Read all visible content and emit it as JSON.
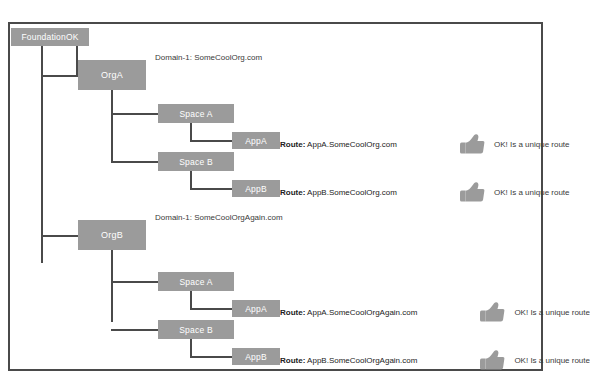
{
  "diagram": {
    "root": {
      "label": "FoundationOK"
    },
    "orgs": [
      {
        "label": "OrgA",
        "domain_label": "Domain-1: SomeCoolOrg.com",
        "spaces": [
          {
            "label": "Space A",
            "app": {
              "label": "AppA",
              "route_key": "Route:",
              "route_value": "AppA.SomeCoolOrg.com",
              "status_icon": "thumbs-up-icon",
              "status_text": "OK! Is a unique route"
            }
          },
          {
            "label": "Space B",
            "app": {
              "label": "AppB",
              "route_key": "Route:",
              "route_value": "AppB.SomeCoolOrg.com",
              "status_icon": "thumbs-up-icon",
              "status_text": "OK! Is a unique route"
            }
          }
        ]
      },
      {
        "label": "OrgB",
        "domain_label": "Domain-1: SomeCoolOrgAgain.com",
        "spaces": [
          {
            "label": "Space A",
            "app": {
              "label": "AppA",
              "route_key": "Route:",
              "route_value": "AppA.SomeCoolOrgAgain.com",
              "status_icon": "thumbs-up-icon",
              "status_text": "OK! Is a unique route"
            }
          },
          {
            "label": "Space B",
            "app": {
              "label": "AppB",
              "route_key": "Route:",
              "route_value": "AppB.SomeCoolOrgAgain.com",
              "status_icon": "thumbs-up-icon",
              "status_text": "OK! Is a unique route"
            }
          }
        ]
      }
    ]
  },
  "colors": {
    "node_fill": "#9b9b9b",
    "node_text": "#ffffff",
    "connector": "#4a4a4a",
    "frame_border": "#4a4a4a",
    "background": "#ffffff",
    "icon_fill": "#9b9b9b"
  }
}
